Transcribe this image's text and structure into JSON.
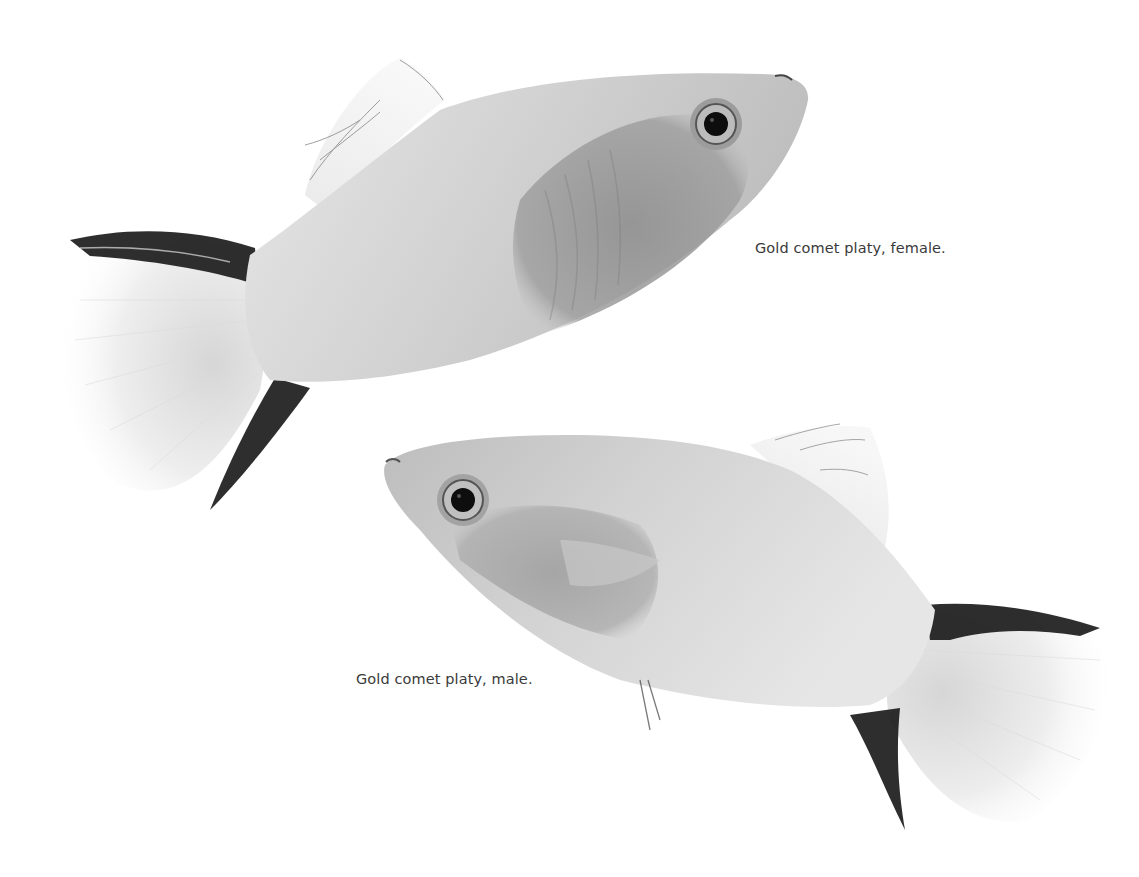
{
  "page": {
    "background": "#ffffff"
  },
  "photos": [
    {
      "id": "female",
      "subject": "gold-comet-platy-female",
      "caption": "Gold comet platy, female.",
      "body_color": "#d9d9d9",
      "belly_shade": "#9a9a9a",
      "fin_stripe_color": "#1a1a1a"
    },
    {
      "id": "male",
      "subject": "gold-comet-platy-male",
      "caption": "Gold comet platy, male.",
      "body_color": "#dcdcdc",
      "belly_shade": "#a8a8a8",
      "fin_stripe_color": "#1a1a1a"
    }
  ]
}
